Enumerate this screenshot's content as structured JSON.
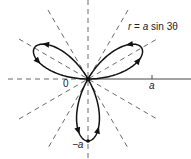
{
  "diagram": {
    "equation_label": "r = a sin 3θ",
    "equation_parts": {
      "r": "r",
      "eq": " = ",
      "a": "a",
      "rest": " sin 3θ"
    },
    "origin_label": "0",
    "x_tick_label": "a",
    "neg_tick_label": "−a",
    "curve_color": "#111111",
    "dashed_color": "#444444",
    "dashed_angles_deg": [
      0,
      30,
      60,
      90,
      120,
      150
    ]
  }
}
